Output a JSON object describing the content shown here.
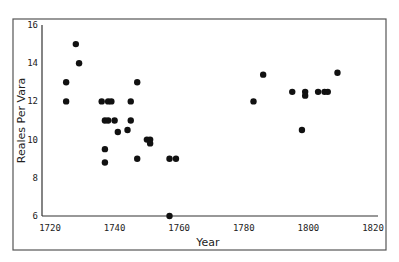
{
  "chart_data": {
    "type": "scatter",
    "title": "",
    "xlabel": "Year",
    "ylabel": "Reales Per Vara",
    "xlim": [
      1720,
      1820
    ],
    "ylim": [
      6,
      16
    ],
    "x_ticks": [
      1720,
      1740,
      1760,
      1780,
      1800,
      1820
    ],
    "y_ticks": [
      6,
      8,
      10,
      12,
      14,
      16
    ],
    "grid": false,
    "legend": null,
    "series": [
      {
        "name": "Reales per vara",
        "color": "#111111",
        "points": [
          {
            "x": 1725,
            "y": 13
          },
          {
            "x": 1725,
            "y": 12
          },
          {
            "x": 1728,
            "y": 15
          },
          {
            "x": 1729,
            "y": 14
          },
          {
            "x": 1736,
            "y": 12
          },
          {
            "x": 1738,
            "y": 12
          },
          {
            "x": 1739,
            "y": 12
          },
          {
            "x": 1745,
            "y": 12
          },
          {
            "x": 1737,
            "y": 11
          },
          {
            "x": 1738,
            "y": 11
          },
          {
            "x": 1740,
            "y": 11
          },
          {
            "x": 1745,
            "y": 11
          },
          {
            "x": 1741,
            "y": 10.4
          },
          {
            "x": 1744,
            "y": 10.5
          },
          {
            "x": 1737,
            "y": 9.5
          },
          {
            "x": 1737,
            "y": 8.8
          },
          {
            "x": 1747,
            "y": 9
          },
          {
            "x": 1747,
            "y": 13
          },
          {
            "x": 1750,
            "y": 10
          },
          {
            "x": 1751,
            "y": 10
          },
          {
            "x": 1751,
            "y": 9.8
          },
          {
            "x": 1757,
            "y": 9
          },
          {
            "x": 1759,
            "y": 9
          },
          {
            "x": 1757,
            "y": 6
          },
          {
            "x": 1783,
            "y": 12
          },
          {
            "x": 1786,
            "y": 13.4
          },
          {
            "x": 1795,
            "y": 12.5
          },
          {
            "x": 1799,
            "y": 12.5
          },
          {
            "x": 1799,
            "y": 12.3
          },
          {
            "x": 1798,
            "y": 10.5
          },
          {
            "x": 1803,
            "y": 12.5
          },
          {
            "x": 1805,
            "y": 12.5
          },
          {
            "x": 1806,
            "y": 12.5
          },
          {
            "x": 1809,
            "y": 13.5
          }
        ]
      }
    ]
  },
  "layout": {
    "frame": {
      "left": 13,
      "top": 19,
      "right": 386,
      "bottom": 250
    },
    "plot": {
      "x0px": 50,
      "x1px": 373,
      "y0px": 216,
      "y1px": 25,
      "axis_x_px": 42
    }
  }
}
